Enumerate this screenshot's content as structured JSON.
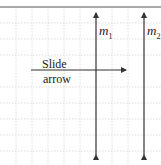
{
  "diagram": {
    "title_fragment": "",
    "arrow_label_line1": "Slide",
    "arrow_label_line2": "arrow",
    "lines": [
      {
        "name": "m",
        "subscript": "1"
      },
      {
        "name": "m",
        "subscript": "2"
      }
    ],
    "colors": {
      "grid": "#c8c8c8",
      "stroke": "#333333",
      "border": "#555555"
    }
  }
}
